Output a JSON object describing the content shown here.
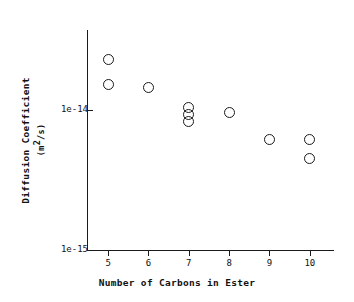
{
  "chart_data": {
    "type": "scatter",
    "title": "",
    "xlabel": "Number of Carbons in Ester",
    "ylabel": "Diffusion Coefficient",
    "ylabel_unit_prefix": "(m",
    "ylabel_unit_sup": "2",
    "ylabel_unit_suffix": "/s)",
    "xlim": [
      4.5,
      10.6
    ],
    "ylim": [
      1e-15,
      3.3e-14
    ],
    "yscale": "log",
    "grid": false,
    "legend": null,
    "marker": "open-circle",
    "marker_color": "#1a1a1a",
    "x_ticks": [
      {
        "value": 5,
        "label": "5"
      },
      {
        "value": 6,
        "label": "6"
      },
      {
        "value": 7,
        "label": "7"
      },
      {
        "value": 8,
        "label": "8"
      },
      {
        "value": 9,
        "label": "9"
      },
      {
        "value": 10,
        "label": "10"
      }
    ],
    "y_ticks": [
      {
        "value": 1e-14,
        "label": "1e-14"
      },
      {
        "value": 1e-15,
        "label": "1e-15"
      }
    ],
    "points": [
      {
        "x": 5,
        "y": 2.3e-14
      },
      {
        "x": 5,
        "y": 1.52e-14
      },
      {
        "x": 6,
        "y": 1.45e-14
      },
      {
        "x": 7,
        "y": 1.05e-14
      },
      {
        "x": 7,
        "y": 9.3e-15
      },
      {
        "x": 7,
        "y": 8.3e-15
      },
      {
        "x": 8,
        "y": 9.6e-15
      },
      {
        "x": 9,
        "y": 6.2e-15
      },
      {
        "x": 10,
        "y": 6.2e-15
      },
      {
        "x": 10,
        "y": 4.5e-15
      }
    ]
  }
}
